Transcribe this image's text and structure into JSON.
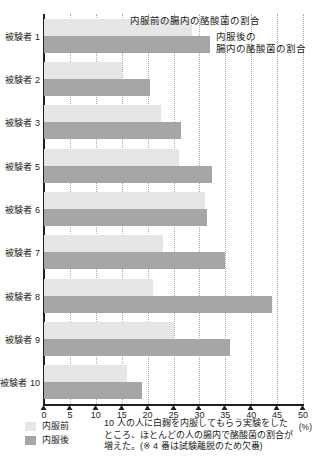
{
  "chart_data": {
    "type": "bar",
    "orientation": "horizontal",
    "title": "",
    "xlabel": "(%)",
    "ylabel": "",
    "xlim": [
      0,
      50
    ],
    "xticks": [
      "0",
      "5",
      "10",
      "15",
      "20",
      "25",
      "30",
      "35",
      "40",
      "45",
      "50"
    ],
    "grid": true,
    "legend_position": "bottom-left",
    "categories": [
      "被験者 1",
      "被験者 2",
      "被験者 3",
      "被験者 5",
      "被験者 6",
      "被験者 7",
      "被験者 8",
      "被験者 9",
      "被験者 10"
    ],
    "series": [
      {
        "name": "内服前",
        "color": "#e6e6e6",
        "values": [
          28.5,
          15.0,
          22.5,
          26.0,
          31.0,
          23.0,
          21.0,
          25.0,
          16.0
        ]
      },
      {
        "name": "内服後",
        "color": "#a6a6a6",
        "values": [
          32.0,
          20.5,
          26.5,
          32.5,
          31.5,
          35.0,
          44.0,
          36.0,
          19.0
        ]
      }
    ],
    "annotations": [
      "内服前の腸内の酪酸菌の割合",
      "内服後の",
      "腸内の酪酸菌の割合"
    ]
  },
  "annotations": {
    "before_label": "内服前の腸内の酪酸菌の割合",
    "after_label_line1": "内服後の",
    "after_label_line2": "腸内の酪酸菌の割合"
  },
  "legend": {
    "items": [
      {
        "label": "内服前",
        "color": "#e6e6e6"
      },
      {
        "label": "内服後",
        "color": "#a6a6a6"
      }
    ]
  },
  "caption": {
    "line1": "10 人の人に白麹を内服してもらう実験をした",
    "line2": "ところ、ほとんどの人の腸内で酪酸菌の割合が",
    "line3": "増えた。(※ 4 番は試験離脱のため欠番)"
  },
  "axis": {
    "unit": "(%)"
  }
}
